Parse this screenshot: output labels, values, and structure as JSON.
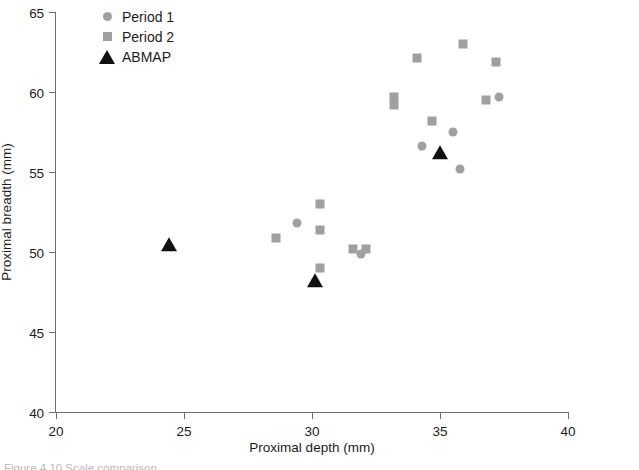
{
  "chart_data": {
    "type": "scatter",
    "title": "",
    "xlabel": "Proximal depth (mm)",
    "ylabel": "Proximal breadth (mm)",
    "xlim": [
      20,
      40
    ],
    "ylim": [
      40,
      65
    ],
    "xticks": [
      20,
      25,
      30,
      35,
      40
    ],
    "yticks": [
      40,
      45,
      50,
      55,
      60,
      65
    ],
    "grid": false,
    "legend_position": "top-left-inside",
    "series": [
      {
        "name": "Period 1",
        "marker": "circle",
        "color": "#a0a0a0",
        "points": [
          [
            29.4,
            51.8
          ],
          [
            31.9,
            49.9
          ],
          [
            34.3,
            56.6
          ],
          [
            35.5,
            57.5
          ],
          [
            35.8,
            55.2
          ],
          [
            37.3,
            59.7
          ]
        ]
      },
      {
        "name": "Period 2",
        "marker": "square",
        "color": "#a0a0a0",
        "points": [
          [
            28.6,
            50.9
          ],
          [
            30.3,
            53.0
          ],
          [
            30.3,
            51.4
          ],
          [
            30.3,
            49.0
          ],
          [
            31.6,
            50.2
          ],
          [
            32.1,
            50.2
          ],
          [
            33.2,
            59.7
          ],
          [
            33.2,
            59.2
          ],
          [
            34.1,
            62.1
          ],
          [
            34.7,
            58.2
          ],
          [
            35.9,
            63.0
          ],
          [
            36.8,
            59.5
          ],
          [
            37.2,
            61.9
          ]
        ]
      },
      {
        "name": "ABMAP",
        "marker": "triangle",
        "color": "#111111",
        "points": [
          [
            24.4,
            50.4
          ],
          [
            30.1,
            48.1
          ],
          [
            35.0,
            56.1
          ]
        ]
      }
    ]
  },
  "legend": {
    "entries": [
      {
        "label": "Period 1",
        "marker": "circle",
        "color": "#a0a0a0"
      },
      {
        "label": "Period 2",
        "marker": "square",
        "color": "#a0a0a0"
      },
      {
        "label": "ABMAP",
        "marker": "triangle",
        "color": "#111111"
      }
    ]
  },
  "axes": {
    "x_title": "Proximal depth (mm)",
    "y_title": "Proximal breadth (mm)",
    "x_tick_labels": [
      "20",
      "25",
      "30",
      "35",
      "40"
    ],
    "y_tick_labels": [
      "40",
      "45",
      "50",
      "55",
      "60",
      "65"
    ]
  },
  "colors": {
    "axis": "#6e6e6e",
    "text": "#1c1c1c",
    "series_gray": "#a0a0a0",
    "series_black": "#111111"
  },
  "caption": "Figure 4.10  Scale comparison"
}
